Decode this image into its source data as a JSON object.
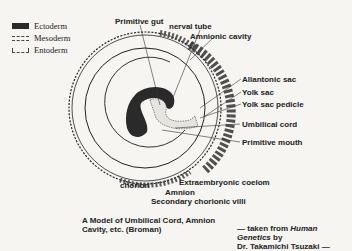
{
  "legend": {
    "items": [
      {
        "label": "Ectoderm",
        "pattern": "solid-dark"
      },
      {
        "label": "Mesoderm",
        "pattern": "dashed"
      },
      {
        "label": "Entoderm",
        "pattern": "dashed-bracket"
      }
    ]
  },
  "labels": {
    "primitive_gut": "Primitive gut",
    "nerval_tube": "nerval tube",
    "amnionic_cavity": "Amnionic cavity",
    "allantonic_sac": "Allantonic sac",
    "yolk_sac": "Yolk sac",
    "yolk_sac_pedicle": "Yolk sac pedicle",
    "umbilical_cord": "Umbilical cord",
    "primitive_mouth": "Primitive mouth",
    "chorion": "chorion",
    "extraembryonic_coelom": "Extraembryonic coelom",
    "amnion": "Amnion",
    "secondary_chorionic_villi": "Secondary chorionic villi"
  },
  "caption": {
    "line1": "A Model of Umbilical Cord, Amnion",
    "line2": "Cavity, etc. (Broman)"
  },
  "credit": {
    "prefix": "— taken from ",
    "book": "Human Genetics",
    "suffix": " by",
    "line2": "Dr. Takamichi Tsuzaki —"
  },
  "colors": {
    "background": "#f6f5f2",
    "ink": "#1a1a1a",
    "ectoderm": "#2a2a2a"
  }
}
